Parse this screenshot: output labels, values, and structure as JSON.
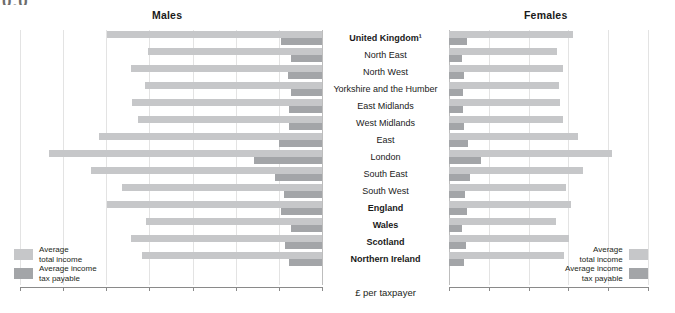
{
  "artifact": {
    "text": "0.0"
  },
  "panels": {
    "left_title": "Males",
    "right_title": "Females"
  },
  "axis": {
    "center_label": "£ per taxpayer",
    "left_ticks": [
      "28,000",
      "24,000",
      "20,000",
      "16,000",
      "12,000",
      "8,000",
      "4,000",
      "0"
    ],
    "right_ticks": [
      "0",
      "4,000",
      "8,000",
      "12,000",
      "16,000",
      "20,000"
    ],
    "left_max": 28000,
    "right_max": 20000
  },
  "legend": {
    "income_line1": "Average",
    "income_line2": "total income",
    "tax_line1": "Average income",
    "tax_line2": "tax payable",
    "income_swatch": "income-swatch",
    "tax_swatch": "tax-swatch"
  },
  "colors": {
    "income": "#c6c7c9",
    "tax": "#a3a5a8",
    "grid": "#e3e3e3",
    "axis": "#8a8a8a"
  },
  "chart_data": {
    "type": "bar",
    "xlabel": "£ per taxpayer",
    "ylabel": "",
    "grid": true,
    "legend_position": "bottom-outer",
    "orientation": "horizontal-butterfly",
    "panels": [
      "Males",
      "Females"
    ],
    "xlim_left": [
      28000,
      0
    ],
    "xlim_right": [
      0,
      20000
    ],
    "categories": [
      "United Kingdom¹",
      "North East",
      "North West",
      "Yorkshire and the Humber",
      "East Midlands",
      "West Midlands",
      "East",
      "London",
      "South East",
      "South West",
      "England",
      "Wales",
      "Scotland",
      "Northern Ireland"
    ],
    "bold_categories": [
      "United Kingdom¹",
      "England",
      "Wales",
      "Scotland",
      "Northern Ireland"
    ],
    "series": [
      {
        "name": "Males — Average total income",
        "panel": "Males",
        "color": "#c6c7c9",
        "values": [
          19900,
          16100,
          17700,
          16400,
          17600,
          17100,
          20700,
          25300,
          21400,
          18500,
          19900,
          16300,
          17700,
          16700
        ]
      },
      {
        "name": "Males — Average income tax payable",
        "panel": "Males",
        "color": "#a3a5a8",
        "values": [
          3800,
          2900,
          3200,
          2900,
          3100,
          3100,
          4000,
          6300,
          4400,
          3500,
          3800,
          2900,
          3400,
          3100
        ]
      },
      {
        "name": "Females — Average total income",
        "panel": "Females",
        "color": "#c6c7c9",
        "values": [
          12500,
          10900,
          11500,
          11100,
          11200,
          11500,
          13000,
          16400,
          13500,
          11800,
          12300,
          10800,
          12100,
          11600
        ]
      },
      {
        "name": "Females — Average income tax payable",
        "panel": "Females",
        "color": "#a3a5a8",
        "values": [
          1800,
          1300,
          1500,
          1400,
          1400,
          1500,
          1900,
          3200,
          2100,
          1600,
          1800,
          1300,
          1700,
          1500
        ]
      }
    ]
  }
}
